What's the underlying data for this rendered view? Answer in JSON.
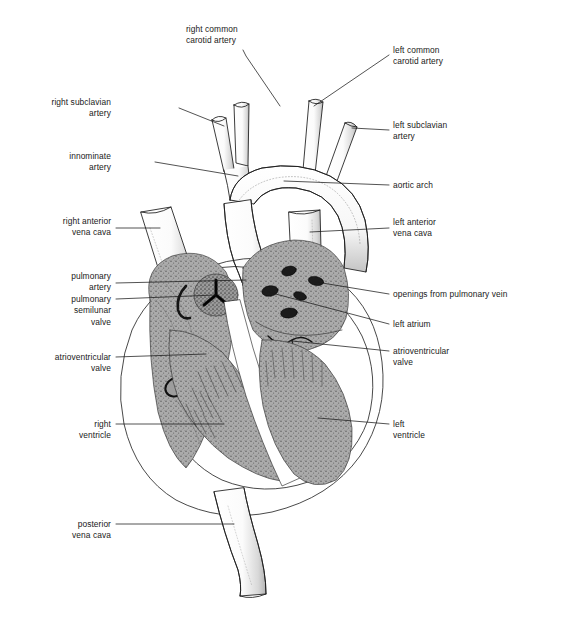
{
  "figure": {
    "background_color": "#ffffff",
    "ink_color": "#1a1a1a",
    "chamber_fill": "#a8a8a8",
    "vessel_fill": "#ffffff",
    "label_font_size_px": 8.4
  },
  "labels": {
    "right_common_carotid_artery": "right common\ncarotid artery",
    "left_common_carotid_artery": "left common\ncarotid artery",
    "right_subclavian_artery": "right subclavian\nartery",
    "left_subclavian_artery": "left subclavian\nartery",
    "innominate_artery": "innominate\nartery",
    "aortic_arch": "aortic arch",
    "right_anterior_vena_cava": "right anterior\nvena cava",
    "left_anterior_vena_cava": "left anterior\nvena cava",
    "pulmonary_artery": "pulmonary\nartery",
    "pulmonary_semilunar_valve": "pulmonary\nsemilunar\nvalve",
    "openings_from_pulmonary_vein": "openings from pulmonary vein",
    "left_atrium": "left atrium",
    "atrioventricular_valve_right": "atrioventricular\nvalve",
    "atrioventricular_valve_left": "atrioventricular\nvalve",
    "right_ventricle": "right\nventricle",
    "left_ventricle": "left\nventricle",
    "posterior_vena_cava": "posterior\nvena cava"
  }
}
